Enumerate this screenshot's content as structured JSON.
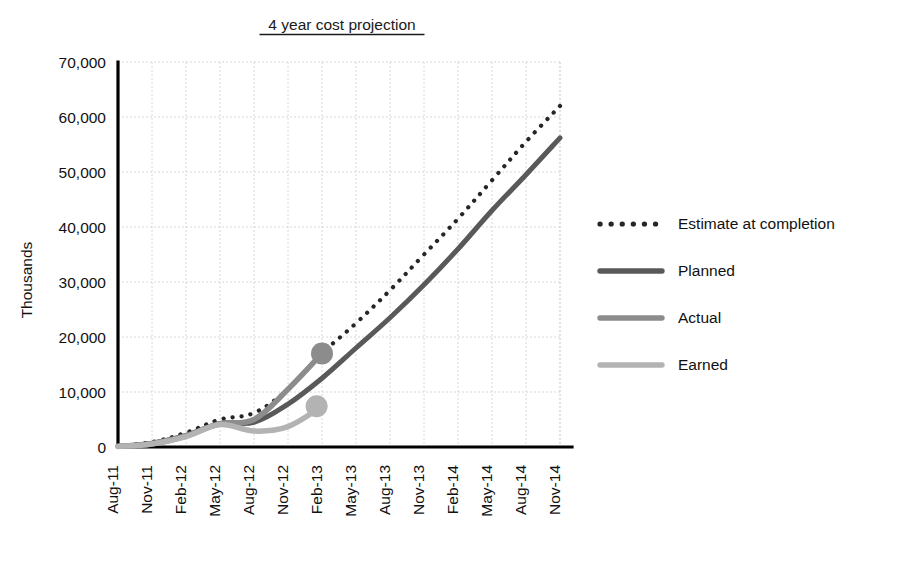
{
  "chart_data": {
    "type": "line",
    "title": "4 year cost projection",
    "xlabel": "",
    "ylabel": "Thousands",
    "ylim": [
      0,
      70000
    ],
    "ytick_step": 10000,
    "ytick_labels": [
      "0",
      "10,000",
      "20,000",
      "30,000",
      "40,000",
      "50,000",
      "60,000",
      "70,000"
    ],
    "ytick_values": [
      0,
      10000,
      20000,
      30000,
      40000,
      50000,
      60000,
      70000
    ],
    "grid": true,
    "legend_position": "right",
    "categories": [
      "Aug-11",
      "Nov-11",
      "Feb-12",
      "May-12",
      "Aug-12",
      "Nov-12",
      "Feb-13",
      "May-13",
      "Aug-13",
      "Nov-13",
      "Feb-14",
      "May-14",
      "Aug-14",
      "Nov-14"
    ],
    "series": [
      {
        "name": "Estimate at completion",
        "style": "dotted",
        "color": "#262626",
        "width": 4.2,
        "marker_end": false,
        "values": [
          200,
          900,
          2600,
          5000,
          6200,
          10500,
          17000,
          22500,
          28500,
          35000,
          41500,
          48500,
          55500,
          62000
        ]
      },
      {
        "name": "Planned",
        "style": "solid",
        "color": "#595959",
        "width": 5.0,
        "marker_end": false,
        "values": [
          150,
          700,
          2100,
          4300,
          4500,
          7800,
          12500,
          18000,
          23500,
          29500,
          36000,
          43000,
          49500,
          56200
        ]
      },
      {
        "name": "Actual",
        "style": "solid",
        "color": "#8c8c8c",
        "width": 5.5,
        "marker_end": true,
        "marker_radius": 11,
        "values": [
          120,
          600,
          2000,
          4200,
          5000,
          10500,
          17000,
          null,
          null,
          null,
          null,
          null,
          null,
          null
        ]
      },
      {
        "name": "Earned",
        "style": "solid",
        "color": "#b3b3b3",
        "width": 5.5,
        "marker_end": true,
        "marker_radius": 11,
        "marker_x_offset": -0.3,
        "values": [
          100,
          550,
          1900,
          4100,
          2900,
          3700,
          7400,
          null,
          null,
          null,
          null,
          null,
          null,
          null
        ]
      }
    ],
    "legend": [
      {
        "label": "Estimate at completion",
        "style": "dotted",
        "color": "#262626"
      },
      {
        "label": "Planned",
        "style": "solid",
        "color": "#595959"
      },
      {
        "label": "Actual",
        "style": "solid",
        "color": "#8c8c8c"
      },
      {
        "label": "Earned",
        "style": "solid",
        "color": "#b3b3b3"
      }
    ]
  },
  "layout": {
    "plot_left": 118,
    "plot_right": 560,
    "plot_top": 62,
    "plot_bottom": 447,
    "title_x": 342,
    "title_y": 30,
    "ylabel_x": 32,
    "ylabel_y": 280,
    "legend_x_swatch": 600,
    "legend_x_text": 678,
    "legend_y_start": 224,
    "legend_row_gap": 47,
    "legend_swatch_width": 62
  }
}
